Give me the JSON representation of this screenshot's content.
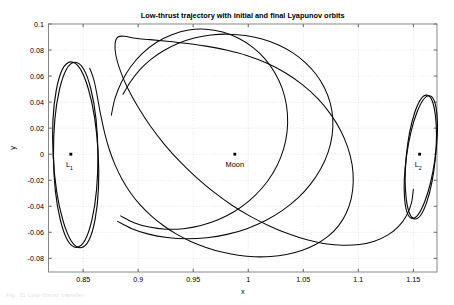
{
  "figure": {
    "caption_fragment": "Fig. 11  Low-thrust transfer",
    "background": "#ffffff",
    "line_color": "#0a0a0a",
    "grid_color": "#c9c9c9"
  },
  "chart_data": {
    "type": "line",
    "title": "Low-thrust trajectory with initial and final Lyapunov orbits",
    "xlabel": "x",
    "ylabel": "y",
    "xlim": [
      0.8185,
      1.1715
    ],
    "ylim": [
      -0.0905,
      0.1
    ],
    "grid": true,
    "legend": null,
    "xticks": [
      0.85,
      0.9,
      0.95,
      1,
      1.05,
      1.1,
      1.15
    ],
    "xticklabels": [
      "0.85",
      "0.9",
      "0.95",
      "1",
      "1.05",
      "1.1",
      "1.15"
    ],
    "yticks": [
      0.1,
      0.08,
      0.06,
      0.04,
      0.02,
      0,
      -0.02,
      -0.04,
      -0.06,
      -0.08
    ],
    "yticklabels": [
      "0.1",
      "0.08",
      "0.06",
      "0.04",
      "0.02",
      "0",
      "-0.02",
      "-0.04",
      "-0.06",
      "-0.08"
    ],
    "annotations": [
      {
        "name": "L1",
        "label": "L",
        "subscript": "1",
        "x": 0.8388,
        "y": 0.0,
        "marker": "square"
      },
      {
        "name": "Moon",
        "label": "Moon",
        "subscript": "",
        "x": 0.9878,
        "y": 0.0,
        "marker": "square"
      },
      {
        "name": "L2",
        "label": "L",
        "subscript": "2",
        "x": 1.1557,
        "y": 0.0,
        "marker": "square"
      }
    ],
    "series": [
      {
        "name": "initial-lyapunov-orbit-L1",
        "kind": "closed-orbit",
        "description": "Initial Lyapunov orbit about L1",
        "center": [
          0.8432,
          -0.0005
        ],
        "semi_x": 0.0205,
        "semi_y": 0.0715,
        "rotation_deg": -3.0
      },
      {
        "name": "final-lyapunov-orbit-L2",
        "kind": "closed-orbit",
        "description": "Final Lyapunov orbit about L2",
        "center": [
          1.1568,
          -0.0022
        ],
        "semi_x": 0.0132,
        "semi_y": 0.0478,
        "rotation_deg": 5.5
      },
      {
        "name": "low-thrust-transfer",
        "kind": "trajectory",
        "description": "Low-thrust spiral transfer from L1 Lyapunov orbit to L2 Lyapunov orbit",
        "points": [
          [
            0.856,
            0.066
          ],
          [
            0.8592,
            0.0586
          ],
          [
            0.8616,
            0.05
          ],
          [
            0.8638,
            0.0398
          ],
          [
            0.8664,
            0.0282
          ],
          [
            0.8696,
            0.016
          ],
          [
            0.8736,
            0.004
          ],
          [
            0.8788,
            -0.0078
          ],
          [
            0.8852,
            -0.019
          ],
          [
            0.8928,
            -0.0294
          ],
          [
            0.9016,
            -0.0388
          ],
          [
            0.9116,
            -0.0472
          ],
          [
            0.9228,
            -0.0548
          ],
          [
            0.9348,
            -0.0614
          ],
          [
            0.9478,
            -0.067
          ],
          [
            0.9616,
            -0.0716
          ],
          [
            0.976,
            -0.0752
          ],
          [
            0.9908,
            -0.0776
          ],
          [
            1.0056,
            -0.0788
          ],
          [
            1.0204,
            -0.0786
          ],
          [
            1.0348,
            -0.077
          ],
          [
            1.0486,
            -0.074
          ],
          [
            1.0612,
            -0.0694
          ],
          [
            1.0724,
            -0.0632
          ],
          [
            1.0818,
            -0.0552
          ],
          [
            1.089,
            -0.0454
          ],
          [
            1.0936,
            -0.034
          ],
          [
            1.0954,
            -0.0214
          ],
          [
            1.0944,
            -0.0082
          ],
          [
            1.0904,
            0.0052
          ],
          [
            1.0838,
            0.0184
          ],
          [
            1.0746,
            0.031
          ],
          [
            1.063,
            0.0428
          ],
          [
            1.0492,
            0.0534
          ],
          [
            1.0336,
            0.0626
          ],
          [
            1.0166,
            0.07
          ],
          [
            0.9986,
            0.0758
          ],
          [
            0.98,
            0.08
          ],
          [
            0.9614,
            0.083
          ],
          [
            0.9432,
            0.0852
          ],
          [
            0.9262,
            0.0868
          ],
          [
            0.9108,
            0.088
          ],
          [
            0.8976,
            0.089
          ],
          [
            0.8876,
            0.0906
          ],
          [
            0.8816,
            0.09
          ],
          [
            0.879,
            0.0848
          ],
          [
            0.8798,
            0.0756
          ],
          [
            0.8838,
            0.064
          ],
          [
            0.8906,
            0.0504
          ],
          [
            0.9,
            0.036
          ],
          [
            0.9112,
            0.0214
          ],
          [
            0.924,
            0.0074
          ],
          [
            0.938,
            -0.0058
          ],
          [
            0.953,
            -0.018
          ],
          [
            0.9688,
            -0.0292
          ],
          [
            0.9852,
            -0.0392
          ],
          [
            1.002,
            -0.0478
          ],
          [
            1.0192,
            -0.0552
          ],
          [
            1.0364,
            -0.0612
          ],
          [
            1.0534,
            -0.0658
          ],
          [
            1.07,
            -0.0688
          ],
          [
            1.086,
            -0.07
          ],
          [
            1.101,
            -0.0694
          ],
          [
            1.1146,
            -0.0668
          ],
          [
            1.1266,
            -0.0622
          ],
          [
            1.1364,
            -0.0556
          ],
          [
            1.1436,
            -0.0474
          ],
          [
            1.1482,
            -0.0378
          ],
          [
            1.15,
            -0.027
          ]
        ]
      },
      {
        "name": "inner-loop-arc",
        "kind": "trajectory",
        "description": "Inner revolution of the spiral transfer about the Moon",
        "points": [
          [
            0.8862,
            0.046
          ],
          [
            0.893,
            0.0556
          ],
          [
            0.9014,
            0.0648
          ],
          [
            0.9116,
            0.0728
          ],
          [
            0.9234,
            0.0796
          ],
          [
            0.9366,
            0.0852
          ],
          [
            0.951,
            0.0892
          ],
          [
            0.9662,
            0.0916
          ],
          [
            0.9818,
            0.0922
          ],
          [
            0.9974,
            0.0912
          ],
          [
            1.0126,
            0.0884
          ],
          [
            1.027,
            0.084
          ],
          [
            1.0402,
            0.078
          ],
          [
            1.0518,
            0.0704
          ],
          [
            1.0616,
            0.0614
          ],
          [
            1.0692,
            0.051
          ],
          [
            1.0744,
            0.0396
          ],
          [
            1.0768,
            0.0272
          ],
          [
            1.0762,
            0.0144
          ],
          [
            1.0726,
            0.0016
          ],
          [
            1.066,
            -0.011
          ],
          [
            1.0568,
            -0.0228
          ],
          [
            1.0452,
            -0.0336
          ],
          [
            1.0314,
            -0.043
          ],
          [
            1.0158,
            -0.051
          ],
          [
            0.9988,
            -0.0572
          ],
          [
            0.9808,
            -0.0616
          ],
          [
            0.9624,
            -0.0642
          ],
          [
            0.944,
            -0.065
          ],
          [
            0.9262,
            -0.064
          ],
          [
            0.9094,
            -0.0614
          ],
          [
            0.8942,
            -0.0572
          ],
          [
            0.8812,
            -0.0516
          ]
        ]
      },
      {
        "name": "outer-loop-arc",
        "kind": "trajectory",
        "description": "Outer revolution of the spiral transfer about the Moon",
        "points": [
          [
            0.8756,
            0.03
          ],
          [
            0.879,
            0.043
          ],
          [
            0.885,
            0.0556
          ],
          [
            0.8932,
            0.0672
          ],
          [
            0.9038,
            0.0774
          ],
          [
            0.9164,
            0.0858
          ],
          [
            0.9306,
            0.0918
          ],
          [
            0.9458,
            0.0954
          ],
          [
            0.9614,
            0.096
          ],
          [
            0.9768,
            0.0938
          ],
          [
            0.9912,
            0.089
          ],
          [
            1.0042,
            0.082
          ],
          [
            1.0154,
            0.073
          ],
          [
            1.0244,
            0.0622
          ],
          [
            1.031,
            0.0502
          ],
          [
            1.0348,
            0.0372
          ],
          [
            1.0358,
            0.0238
          ],
          [
            1.034,
            0.0104
          ],
          [
            1.0294,
            -0.0026
          ],
          [
            1.0222,
            -0.0148
          ],
          [
            1.0126,
            -0.026
          ],
          [
            1.0008,
            -0.0358
          ],
          [
            0.9874,
            -0.044
          ],
          [
            0.9726,
            -0.0504
          ],
          [
            0.957,
            -0.0548
          ],
          [
            0.941,
            -0.0572
          ],
          [
            0.9252,
            -0.0576
          ],
          [
            0.91,
            -0.056
          ],
          [
            0.8962,
            -0.0526
          ],
          [
            0.884,
            -0.0474
          ]
        ]
      }
    ]
  }
}
